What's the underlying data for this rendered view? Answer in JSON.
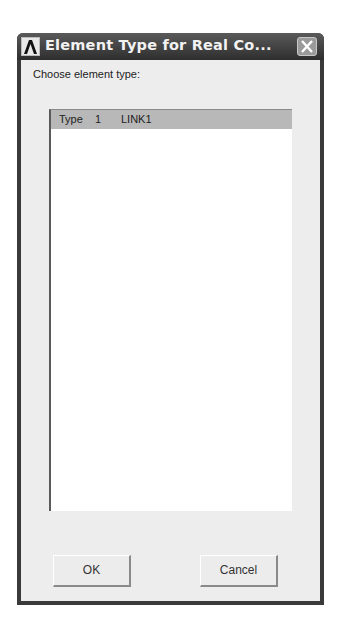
{
  "window": {
    "title": "Element Type for Real Co...",
    "app_icon": "ansys-logo-icon",
    "close_icon": "close-icon"
  },
  "prompt": "Choose element type:",
  "list": {
    "items": [
      {
        "label": "Type",
        "number": "1",
        "name": "LINK1",
        "selected": true
      }
    ]
  },
  "buttons": {
    "ok": "OK",
    "cancel": "Cancel"
  },
  "colors": {
    "titlebar": "#3a3a3a",
    "client_bg": "#ededed",
    "selection": "#b8b8b8"
  }
}
